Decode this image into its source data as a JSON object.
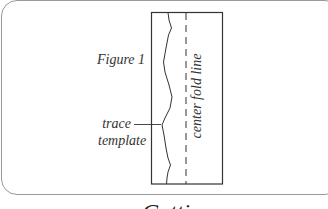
{
  "figure": {
    "label": "Figure 1",
    "annotation_trace": "trace",
    "annotation_template": "template",
    "fold_line_label": "center fold line"
  },
  "section": {
    "heading": "Cutting"
  },
  "colors": {
    "line": "#333333",
    "frame": "#9a9a9a",
    "background": "#ffffff"
  }
}
